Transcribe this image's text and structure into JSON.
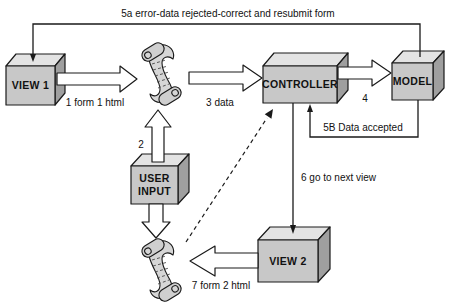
{
  "diagram": {
    "title_arrow_5a": "5a error-data rejected-correct and resubmit form",
    "nodes": {
      "view1": "VIEW 1",
      "controller": "CONTROLLER",
      "model": "MODEL",
      "user_input_line1": "USER",
      "user_input_line2": "INPUT",
      "view2": "VIEW 2"
    },
    "edges": {
      "e1": "1 form 1 html",
      "e2": "2",
      "e3": "3 data",
      "e4": "4",
      "e5b": "5B Data accepted",
      "e6": "6 go to next view",
      "e7": "7 form 2 html"
    },
    "icons": {
      "scroll": "paper-scroll"
    },
    "colors": {
      "box_front": "#c8c8c8",
      "box_top": "#e3e3e3",
      "box_side": "#9f9f9f",
      "scroll_fill": "#d6d6d6",
      "roll_fill": "#cfcfcf",
      "arrow_fill": "#ffffff",
      "line": "#1a1a1a",
      "background": "#ffffff"
    }
  }
}
